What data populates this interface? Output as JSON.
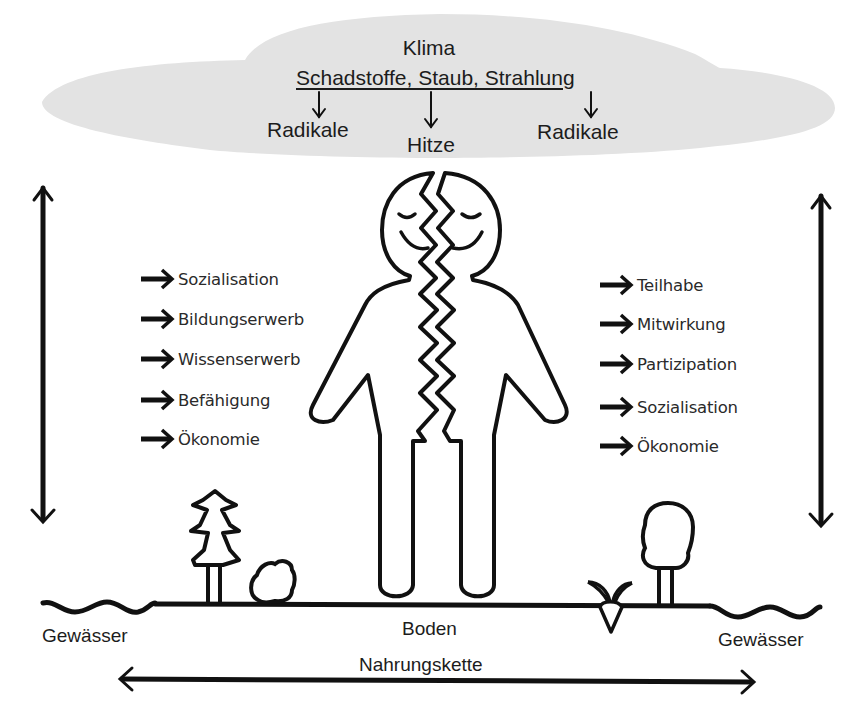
{
  "cloud": {
    "title": "Klima",
    "sources": "Schadstoffe, Staub, Strahlung",
    "effects": [
      {
        "label": "Radikale",
        "position": "left"
      },
      {
        "label": "Hitze",
        "position": "center"
      },
      {
        "label": "Radikale",
        "position": "right"
      }
    ],
    "fill_color": "#e3e3e3"
  },
  "figure": {
    "expression": "smiling-eyes-closed"
  },
  "left_list": {
    "items": [
      {
        "label": "Sozialisation"
      },
      {
        "label": "Bildungserwerb"
      },
      {
        "label": "Wissenserwerb"
      },
      {
        "label": "Befähigung"
      },
      {
        "label": "Ökonomie"
      }
    ]
  },
  "right_list": {
    "items": [
      {
        "label": "Teilhabe"
      },
      {
        "label": "Mitwirkung"
      },
      {
        "label": "Partizipation"
      },
      {
        "label": "Sozialisation"
      },
      {
        "label": "Ökonomie"
      }
    ]
  },
  "ground": {
    "left_water": "Gewässer",
    "soil": "Boden",
    "right_water": "Gewässer",
    "food_chain": "Nahrungskette"
  },
  "colors": {
    "stroke": "#111111",
    "cloud": "#e3e3e3",
    "background": "#ffffff"
  }
}
